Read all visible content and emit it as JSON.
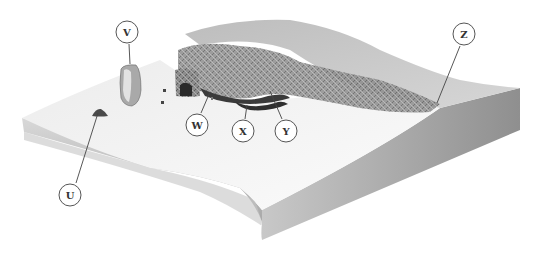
{
  "diagram": {
    "type": "block-diagram",
    "labels": [
      {
        "id": "U",
        "text": "U",
        "cx": 70,
        "cy": 195,
        "target": [
          98,
          113
        ]
      },
      {
        "id": "V",
        "text": "V",
        "cx": 127,
        "cy": 32,
        "target": [
          130,
          64
        ]
      },
      {
        "id": "W",
        "text": "W",
        "cx": 197,
        "cy": 125,
        "target": [
          210,
          92
        ]
      },
      {
        "id": "X",
        "text": "X",
        "cx": 243,
        "cy": 131,
        "target": [
          247,
          105
        ]
      },
      {
        "id": "Y",
        "text": "Y",
        "cx": 286,
        "cy": 131,
        "target": [
          270,
          91
        ]
      },
      {
        "id": "Z",
        "text": "Z",
        "cx": 464,
        "cy": 34,
        "target": [
          437,
          103
        ]
      }
    ],
    "colors": {
      "background": "#ffffff",
      "platform_top": "#f4f4f4",
      "platform_side": "#b8b8b8",
      "cliff": "#9a9a9a",
      "upland": "#c6c6c6",
      "label_stroke": "#555555"
    }
  }
}
